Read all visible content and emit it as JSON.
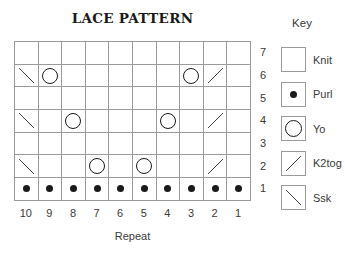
{
  "key_heading": "Key",
  "colors": {
    "ink": "#1a1a1a",
    "grid_line": "#9b9b9b",
    "text": "#3a3a3a",
    "background": "#ffffff"
  },
  "chart_data": {
    "type": "table",
    "title": "LACE PATTERN",
    "xlabel": "Repeat",
    "columns": [
      "10",
      "9",
      "8",
      "7",
      "6",
      "5",
      "4",
      "3",
      "2",
      "1"
    ],
    "row_labels_top_to_bottom": [
      "7",
      "6",
      "5",
      "4",
      "3",
      "2",
      "1"
    ],
    "rows_top_to_bottom": [
      [
        "knit",
        "knit",
        "knit",
        "knit",
        "knit",
        "knit",
        "knit",
        "knit",
        "knit",
        "knit"
      ],
      [
        "ssk",
        "yo",
        "knit",
        "knit",
        "knit",
        "knit",
        "knit",
        "yo",
        "k2tog",
        "knit"
      ],
      [
        "knit",
        "knit",
        "knit",
        "knit",
        "knit",
        "knit",
        "knit",
        "knit",
        "knit",
        "knit"
      ],
      [
        "ssk",
        "knit",
        "yo",
        "knit",
        "knit",
        "knit",
        "yo",
        "knit",
        "k2tog",
        "knit"
      ],
      [
        "knit",
        "knit",
        "knit",
        "knit",
        "knit",
        "knit",
        "knit",
        "knit",
        "knit",
        "knit"
      ],
      [
        "ssk",
        "knit",
        "knit",
        "yo",
        "knit",
        "yo",
        "knit",
        "knit",
        "k2tog",
        "knit"
      ],
      [
        "purl",
        "purl",
        "purl",
        "purl",
        "purl",
        "purl",
        "purl",
        "purl",
        "purl",
        "purl"
      ]
    ],
    "legend_position": "right",
    "grid": true,
    "legend": [
      {
        "symbol": "knit",
        "label": "Knit"
      },
      {
        "symbol": "purl",
        "label": "Purl"
      },
      {
        "symbol": "yo",
        "label": "Yo"
      },
      {
        "symbol": "k2tog",
        "label": "K2tog"
      },
      {
        "symbol": "ssk",
        "label": "Ssk"
      }
    ]
  }
}
